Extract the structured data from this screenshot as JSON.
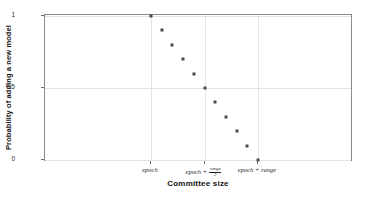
{
  "chart_data": {
    "type": "scatter",
    "title": "",
    "xlabel": "Committee size",
    "ylabel": "Probability of adding a new model",
    "ylim": [
      0,
      1
    ],
    "yticks": [
      "0",
      "0.5",
      "1"
    ],
    "ytick_values": [
      0,
      0.5,
      1
    ],
    "xtick_labels": [
      "epoch",
      "epoch + range/2",
      "epoch + range"
    ],
    "xtick_parts": [
      {
        "text": "epoch",
        "fraction": null
      },
      {
        "text": "epoch + ",
        "fraction": {
          "numerator": "range",
          "denominator": "2"
        }
      },
      {
        "text": "epoch + range",
        "fraction": null
      }
    ],
    "xtick_positions": [
      0,
      0.5,
      1
    ],
    "grid": true,
    "legend": null,
    "marker": "square",
    "marker_color": "#4a4a4a",
    "x": [
      0,
      0.05,
      0.1,
      0.15,
      0.2,
      0.25,
      0.3,
      0.35,
      0.4,
      0.45,
      0.5
    ],
    "x_normalized": [
      0.0,
      0.1,
      0.2,
      0.3,
      0.4,
      0.5,
      0.6,
      0.7,
      0.8,
      0.9,
      1.0
    ],
    "values": [
      1.0,
      0.9,
      0.8,
      0.7,
      0.6,
      0.5,
      0.4,
      0.3,
      0.2,
      0.1,
      0.0
    ]
  },
  "axes": {
    "y_title": "Probability of adding a new model",
    "x_title": "Committee size"
  }
}
